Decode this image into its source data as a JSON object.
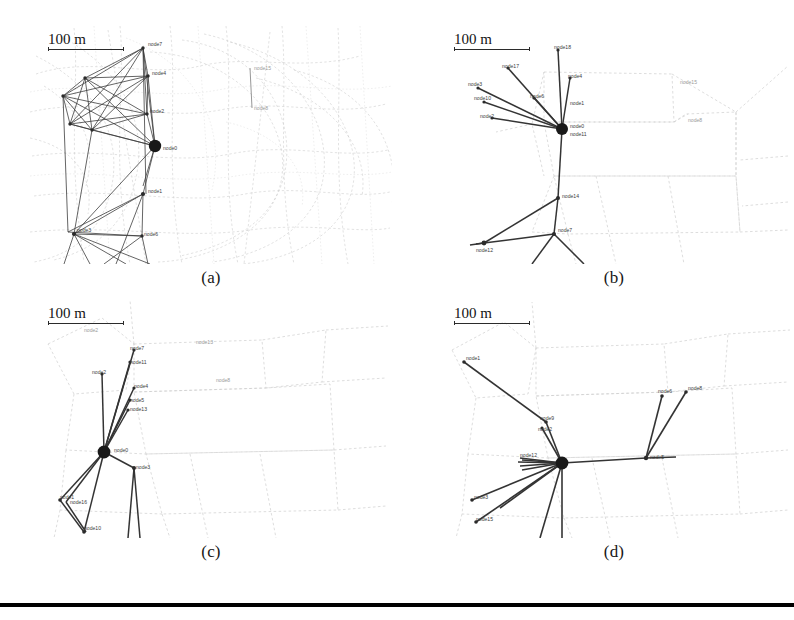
{
  "figure": {
    "title_visible": false,
    "panel_count": 4,
    "scale_bar_text": "100 m",
    "bottom_rule": true,
    "background_color": "#ffffff",
    "link_color": "#303030",
    "hub_color": "#1a1a1a",
    "map_color": "#c8c8c8",
    "label_color": "#3c3c3c"
  },
  "panels": [
    {
      "id": "a",
      "caption": "(a)",
      "scale_bar": "100 m",
      "description": "dense fully-meshed cluster over street map",
      "hub": {
        "label": "node0",
        "x": 125,
        "y": 120
      },
      "node_labels": [
        {
          "text": "node7",
          "x": 146,
          "y": 40
        },
        {
          "text": "node4",
          "x": 150,
          "y": 67
        },
        {
          "text": "node2",
          "x": 146,
          "y": 95
        },
        {
          "text": "node0",
          "x": 136,
          "y": 122
        },
        {
          "text": "node1",
          "x": 140,
          "y": 165
        },
        {
          "text": "node6",
          "x": 116,
          "y": 212
        },
        {
          "text": "node3",
          "x": 57,
          "y": 210
        }
      ],
      "map_labels": [
        {
          "text": "node15",
          "x": 253,
          "y": 75
        },
        {
          "text": "node8",
          "x": 258,
          "y": 110
        }
      ]
    },
    {
      "id": "b",
      "caption": "(b)",
      "scale_bar": "100 m",
      "description": "star topology with backbone chain",
      "hub": {
        "label": "node0",
        "x": 126,
        "y": 103
      },
      "node_labels": [
        {
          "text": "node18",
          "x": 122,
          "y": 26
        },
        {
          "text": "node17",
          "x": 74,
          "y": 45
        },
        {
          "text": "node3",
          "x": 46,
          "y": 62
        },
        {
          "text": "node10",
          "x": 52,
          "y": 76
        },
        {
          "text": "node2",
          "x": 58,
          "y": 94
        },
        {
          "text": "node6",
          "x": 104,
          "y": 74
        },
        {
          "text": "node4",
          "x": 138,
          "y": 53
        },
        {
          "text": "node1",
          "x": 138,
          "y": 79
        },
        {
          "text": "node0",
          "x": 136,
          "y": 105
        },
        {
          "text": "node11",
          "x": 136,
          "y": 112
        },
        {
          "text": "node14",
          "x": 122,
          "y": 172
        },
        {
          "text": "node7",
          "x": 118,
          "y": 208
        },
        {
          "text": "node12",
          "x": 56,
          "y": 218
        }
      ],
      "map_labels": [
        {
          "text": "node15",
          "x": 253,
          "y": 60
        },
        {
          "text": "node8",
          "x": 262,
          "y": 96
        }
      ]
    },
    {
      "id": "c",
      "caption": "(c)",
      "scale_bar": "100 m",
      "description": "star topology, hub lower-left",
      "hub": {
        "label": "node0",
        "x": 74,
        "y": 152
      },
      "node_labels": [
        {
          "text": "node7",
          "x": 108,
          "y": 54
        },
        {
          "text": "node11",
          "x": 106,
          "y": 65
        },
        {
          "text": "node2",
          "x": 76,
          "y": 76
        },
        {
          "text": "node4",
          "x": 110,
          "y": 88
        },
        {
          "text": "node5",
          "x": 106,
          "y": 102
        },
        {
          "text": "node13",
          "x": 106,
          "y": 110
        },
        {
          "text": "node0",
          "x": 86,
          "y": 152
        },
        {
          "text": "node3",
          "x": 110,
          "y": 167
        },
        {
          "text": "node1",
          "x": 40,
          "y": 200
        },
        {
          "text": "node16",
          "x": 46,
          "y": 206
        },
        {
          "text": "node10",
          "x": 58,
          "y": 230
        }
      ],
      "map_labels": [
        {
          "text": "node2",
          "x": 62,
          "y": 30
        },
        {
          "text": "node13",
          "x": 172,
          "y": 45
        },
        {
          "text": "node8",
          "x": 192,
          "y": 80
        }
      ]
    },
    {
      "id": "d",
      "caption": "(d)",
      "scale_bar": "100 m",
      "description": "star topology with two eastern branches",
      "hub": {
        "label": "node0",
        "x": 126,
        "y": 163
      },
      "node_labels": [
        {
          "text": "node1",
          "x": 42,
          "y": 60
        },
        {
          "text": "node9",
          "x": 108,
          "y": 119
        },
        {
          "text": "node2",
          "x": 106,
          "y": 130
        },
        {
          "text": "node12",
          "x": 92,
          "y": 156
        },
        {
          "text": "node6",
          "x": 228,
          "y": 92
        },
        {
          "text": "node8",
          "x": 258,
          "y": 89
        },
        {
          "text": "node5",
          "x": 218,
          "y": 158
        },
        {
          "text": "node3",
          "x": 48,
          "y": 200
        },
        {
          "text": "node15",
          "x": 50,
          "y": 220
        }
      ],
      "map_labels": []
    }
  ]
}
